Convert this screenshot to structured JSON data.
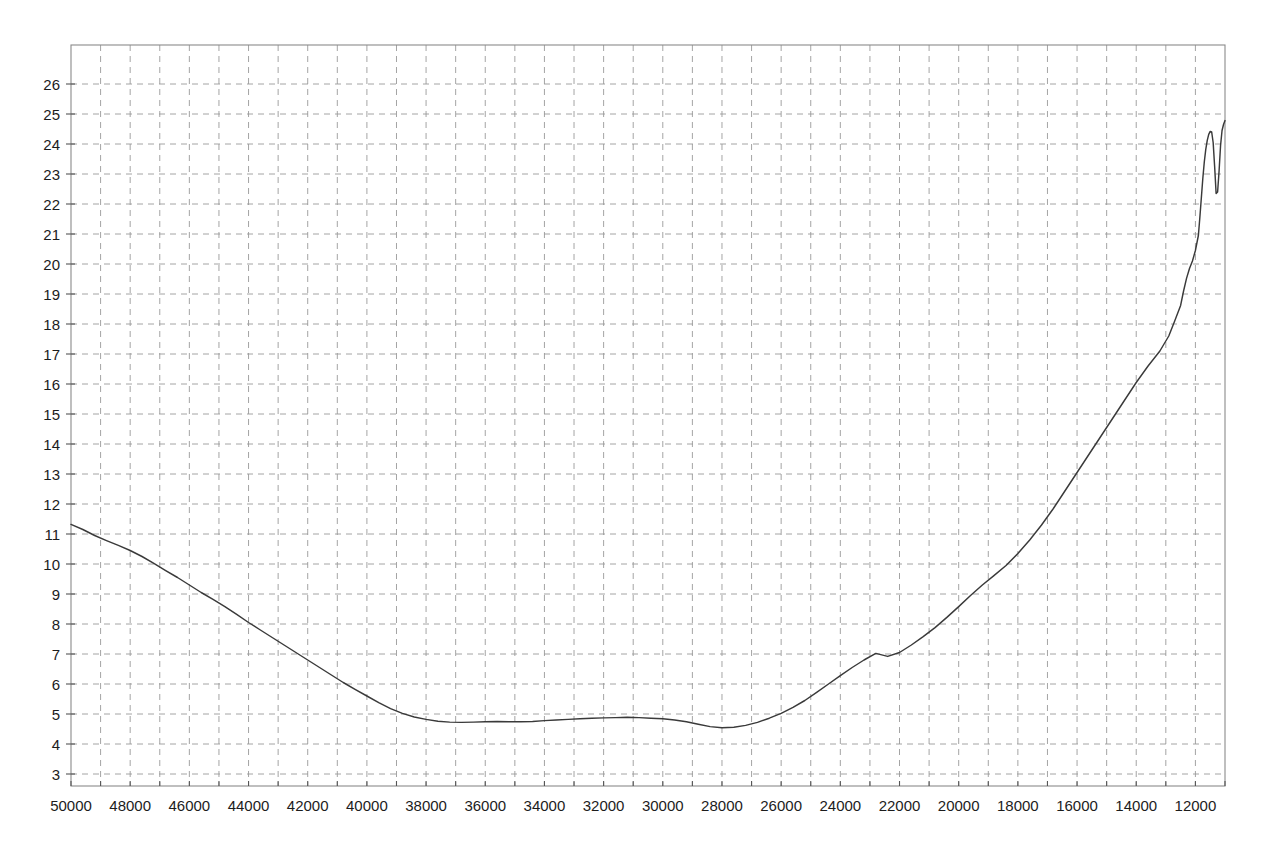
{
  "chart_data": {
    "type": "line",
    "title": "",
    "subtitle": "",
    "xlabel": "",
    "ylabel": "",
    "grid": true,
    "legend": null,
    "x_axis": {
      "reversed": true,
      "range": [
        50000,
        11000
      ],
      "tick_step_major": 2000,
      "tick_step_minor": 1000,
      "tick_labels": [
        "50000",
        "48000",
        "46000",
        "44000",
        "42000",
        "40000",
        "38000",
        "36000",
        "34000",
        "32000",
        "30000",
        "28000",
        "26000",
        "24000",
        "22000",
        "20000",
        "18000",
        "16000",
        "14000",
        "12000"
      ],
      "tick_values": [
        50000,
        48000,
        46000,
        44000,
        42000,
        40000,
        38000,
        36000,
        34000,
        32000,
        30000,
        28000,
        26000,
        24000,
        22000,
        20000,
        18000,
        16000,
        14000,
        12000
      ]
    },
    "y_axis": {
      "range": [
        2.6,
        27.3
      ],
      "tick_step": 1,
      "tick_labels": [
        "26",
        "25",
        "24",
        "23",
        "22",
        "21",
        "20",
        "19",
        "18",
        "17",
        "16",
        "15",
        "14",
        "13",
        "12",
        "11",
        "10",
        "9",
        "8",
        "7",
        "6",
        "5",
        "4",
        "3"
      ],
      "tick_values": [
        26,
        25,
        24,
        23,
        22,
        21,
        20,
        19,
        18,
        17,
        16,
        15,
        14,
        13,
        12,
        11,
        10,
        9,
        8,
        7,
        6,
        5,
        4,
        3
      ]
    },
    "series": [
      {
        "name": "trace",
        "color": "#3a3a3a",
        "x": [
          50000,
          49600,
          49200,
          48800,
          48400,
          48000,
          47600,
          47200,
          46800,
          46400,
          46000,
          45600,
          45200,
          44800,
          44400,
          44000,
          43600,
          43200,
          42800,
          42400,
          42000,
          41600,
          41200,
          40800,
          40400,
          40000,
          39600,
          39200,
          38800,
          38400,
          38000,
          37600,
          37200,
          36800,
          36400,
          36000,
          35600,
          35200,
          34800,
          34400,
          34000,
          33600,
          33200,
          32800,
          32400,
          32000,
          31600,
          31200,
          30800,
          30400,
          30000,
          29600,
          29200,
          28800,
          28400,
          28000,
          27600,
          27200,
          26800,
          26400,
          26000,
          25600,
          25200,
          24800,
          24400,
          24000,
          23600,
          23200,
          22800,
          22400,
          22000,
          21600,
          21200,
          20800,
          20400,
          20000,
          19600,
          19200,
          18800,
          18400,
          18000,
          17600,
          17200,
          16800,
          16400,
          16000,
          15600,
          15200,
          14800,
          14400,
          14000,
          13600,
          13200,
          12900,
          12700,
          12500,
          12400,
          12300,
          12200,
          12100,
          12000,
          11900,
          11850,
          11800,
          11750,
          11700,
          11650,
          11600,
          11550,
          11500,
          11450,
          11400,
          11350,
          11300,
          11250,
          11200,
          11150,
          11100,
          11050,
          11000
        ],
        "y": [
          11.32,
          11.15,
          10.95,
          10.78,
          10.62,
          10.45,
          10.25,
          10.02,
          9.78,
          9.55,
          9.3,
          9.05,
          8.82,
          8.58,
          8.32,
          8.05,
          7.8,
          7.55,
          7.3,
          7.05,
          6.8,
          6.55,
          6.3,
          6.05,
          5.82,
          5.6,
          5.38,
          5.18,
          5.02,
          4.9,
          4.82,
          4.76,
          4.73,
          4.72,
          4.73,
          4.74,
          4.75,
          4.74,
          4.74,
          4.75,
          4.78,
          4.8,
          4.82,
          4.84,
          4.86,
          4.87,
          4.88,
          4.89,
          4.88,
          4.86,
          4.84,
          4.8,
          4.74,
          4.66,
          4.58,
          4.54,
          4.56,
          4.62,
          4.72,
          4.86,
          5.02,
          5.22,
          5.45,
          5.72,
          6.0,
          6.28,
          6.55,
          6.8,
          7.02,
          6.92,
          7.05,
          7.3,
          7.58,
          7.88,
          8.22,
          8.58,
          8.95,
          9.3,
          9.62,
          9.95,
          10.35,
          10.8,
          11.3,
          11.85,
          12.45,
          13.05,
          13.65,
          14.25,
          14.85,
          15.45,
          16.05,
          16.6,
          17.1,
          17.6,
          18.1,
          18.62,
          19.1,
          19.52,
          19.85,
          20.1,
          20.45,
          20.95,
          21.55,
          22.2,
          22.85,
          23.4,
          23.82,
          24.12,
          24.32,
          24.42,
          24.4,
          24.05,
          23.25,
          22.35,
          22.4,
          23.1,
          23.95,
          24.45,
          24.65,
          24.78
        ],
        "notes": "Descends from 11.3 at x=50000 to a broad minimum plateau near 4.5-4.9 between x=40000 and x=31000, then rises steadily to a peak near 24.4 around x=11600, a sharp notch down to ~22.3 near x=11250, then recovers to ~24.8 at the right edge."
      }
    ],
    "annotations": []
  },
  "axes": {
    "x_tick_labels": [
      "50000",
      "48000",
      "46000",
      "44000",
      "42000",
      "40000",
      "38000",
      "36000",
      "34000",
      "32000",
      "30000",
      "28000",
      "26000",
      "24000",
      "22000",
      "20000",
      "18000",
      "16000",
      "14000",
      "12000"
    ],
    "y_tick_labels": [
      "26",
      "25",
      "24",
      "23",
      "22",
      "21",
      "20",
      "19",
      "18",
      "17",
      "16",
      "15",
      "14",
      "13",
      "12",
      "11",
      "10",
      "9",
      "8",
      "7",
      "6",
      "5",
      "4",
      "3"
    ]
  },
  "style": {
    "background": "#ffffff",
    "line_color": "#3a3a3a",
    "grid_color": "#9a9a9a",
    "frame_color": "#8a8a8a",
    "text_color": "#1c1c1c"
  }
}
